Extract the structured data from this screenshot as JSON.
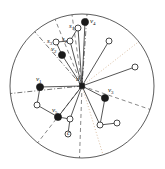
{
  "figure": {
    "type": "node-link-diagram-in-disk",
    "background": "#ffffff",
    "width": 165,
    "height": 169,
    "boundary": {
      "name": "disk-boundary",
      "shape": "circle",
      "cx": 82,
      "cy": 86,
      "r": 72,
      "stroke": "#4a4a4a",
      "stroke_width": 0.9
    },
    "center_node": {
      "id": "u",
      "label": "u",
      "label_text": "u",
      "x": 82,
      "y": 86,
      "marker": "filled-square",
      "size": 5,
      "color": "#1a1a1a",
      "label_dx": -6,
      "label_dy": -10
    }
  },
  "colors": {
    "ink": "#1a1a1a",
    "edge": "#2b2b2b",
    "boundary": "#4a4a4a",
    "dashdot_ray": "#3a3a3a",
    "dashed_ray": "#555555",
    "dotted_ray": "#c8a27a",
    "open_node_fill": "#ffffff"
  },
  "legend_note": "",
  "sector_rays": [
    {
      "name": "ray-west-dashdot",
      "angle_deg": 186,
      "style": "dashdot",
      "color": "#3a3a3a"
    },
    {
      "name": "ray-northwest-dashdot",
      "angle_deg": 131,
      "style": "dashdot",
      "color": "#3a3a3a"
    },
    {
      "name": "ray-north-dashdot",
      "angle_deg": 86,
      "style": "dashdot",
      "color": "#3a3a3a"
    },
    {
      "name": "ray-north-dashed-a",
      "angle_deg": 98,
      "style": "dashed",
      "color": "#555555"
    },
    {
      "name": "ray-northwest-dashed-b",
      "angle_deg": 112,
      "style": "dashed",
      "color": "#555555"
    },
    {
      "name": "ray-northeast-dotted",
      "angle_deg": 38,
      "style": "dotted",
      "color": "#c8a27a"
    },
    {
      "name": "ray-east-dashed",
      "angle_deg": 341,
      "style": "dashed",
      "color": "#555555"
    },
    {
      "name": "ray-southeast-dotted",
      "angle_deg": 287,
      "style": "dotted",
      "color": "#c8a27a"
    },
    {
      "name": "ray-south-dashed",
      "angle_deg": 268,
      "style": "dashed",
      "color": "#555555"
    },
    {
      "name": "ray-southwest-dashed",
      "angle_deg": 232,
      "style": "dashed",
      "color": "#555555"
    }
  ],
  "filled_nodes": [
    {
      "id": "v1",
      "label": "v",
      "sub": "1",
      "x": 40,
      "y": 87,
      "r": 3.6,
      "label_dx": -4,
      "label_dy": -11
    },
    {
      "id": "v2",
      "label": "v",
      "sub": "2",
      "x": 62,
      "y": 55,
      "r": 3.6,
      "label_dx": -11,
      "label_dy": -9
    },
    {
      "id": "v3",
      "label": "v",
      "sub": "3",
      "x": 105,
      "y": 98,
      "r": 3.6,
      "label_dx": 3,
      "label_dy": -11
    },
    {
      "id": "v4",
      "label": "v",
      "sub": "4",
      "x": 85,
      "y": 22,
      "r": 3.6,
      "label_dx": 5,
      "label_dy": -4
    },
    {
      "id": "v5",
      "label": "v",
      "sub": "5",
      "x": 58,
      "y": 117,
      "r": 3.6,
      "label_dx": -6,
      "label_dy": -10
    }
  ],
  "open_nodes": [
    {
      "id": "s1",
      "label": "s",
      "sub": "1",
      "x": 78,
      "y": 28,
      "r": 3.0,
      "label_dx": -9,
      "label_dy": -5
    },
    {
      "id": "s2",
      "label": "s",
      "sub": "2",
      "x": 70,
      "y": 41,
      "r": 3.0,
      "label_dx": -8,
      "label_dy": -5
    },
    {
      "id": "s3",
      "label": "s",
      "sub": "3",
      "x": 56,
      "y": 42,
      "r": 3.0,
      "label_dx": -9,
      "label_dy": -4
    },
    {
      "id": "n1",
      "label": "",
      "sub": "",
      "x": 109,
      "y": 41,
      "r": 3.0,
      "label_dx": 0,
      "label_dy": 0
    },
    {
      "id": "n2",
      "label": "",
      "sub": "",
      "x": 135,
      "y": 67,
      "r": 3.0,
      "label_dx": 0,
      "label_dy": 0
    },
    {
      "id": "n3",
      "label": "",
      "sub": "",
      "x": 37,
      "y": 105,
      "r": 3.0,
      "label_dx": 0,
      "label_dy": 0
    },
    {
      "id": "n4",
      "label": "",
      "sub": "",
      "x": 70,
      "y": 119,
      "r": 3.0,
      "label_dx": 0,
      "label_dy": 0
    },
    {
      "id": "n5",
      "label": "c",
      "sub": "",
      "x": 68,
      "y": 134,
      "r": 3.0,
      "label_dx": -1,
      "label_dy": -4
    },
    {
      "id": "n6",
      "label": "",
      "sub": "",
      "x": 100,
      "y": 125,
      "r": 3.0,
      "label_dx": 0,
      "label_dy": 0
    },
    {
      "id": "n7",
      "label": "",
      "sub": "",
      "x": 117,
      "y": 123,
      "r": 3.0,
      "label_dx": 0,
      "label_dy": 0
    }
  ],
  "edges": [
    {
      "name": "edge-u-v1",
      "from": "u",
      "to": "v1",
      "style": "solid"
    },
    {
      "name": "edge-u-v2",
      "from": "u",
      "to": "v2",
      "style": "solid"
    },
    {
      "name": "edge-u-v3",
      "from": "u",
      "to": "v3",
      "style": "solid"
    },
    {
      "name": "edge-u-v4",
      "from": "u",
      "to": "v4",
      "style": "solid"
    },
    {
      "name": "edge-u-v5",
      "from": "u",
      "to": "v5",
      "style": "solid"
    },
    {
      "name": "edge-u-s1",
      "from": "u",
      "to": "s1",
      "style": "solid"
    },
    {
      "name": "edge-u-s2",
      "from": "u",
      "to": "s2",
      "style": "solid"
    },
    {
      "name": "edge-u-n1",
      "from": "u",
      "to": "n1",
      "style": "solid"
    },
    {
      "name": "edge-u-n2",
      "from": "u",
      "to": "n2",
      "style": "solid"
    },
    {
      "name": "edge-u-n4",
      "from": "u",
      "to": "n4",
      "style": "solid"
    },
    {
      "name": "edge-u-n6",
      "from": "u",
      "to": "n6",
      "style": "solid"
    },
    {
      "name": "edge-v1-n3",
      "from": "v1",
      "to": "n3",
      "style": "solid"
    },
    {
      "name": "edge-v2-s3",
      "from": "v2",
      "to": "s3",
      "style": "solid"
    },
    {
      "name": "edge-s3-s2",
      "from": "s3",
      "to": "s2",
      "style": "solid"
    },
    {
      "name": "edge-s2-s1",
      "from": "s2",
      "to": "s1",
      "style": "solid"
    },
    {
      "name": "edge-n3-v5",
      "from": "n3",
      "to": "v5",
      "style": "solid"
    },
    {
      "name": "edge-v5-n4",
      "from": "v5",
      "to": "n4",
      "style": "solid"
    },
    {
      "name": "edge-n4-n5",
      "from": "n4",
      "to": "n5",
      "style": "solid"
    },
    {
      "name": "edge-v3-n6",
      "from": "v3",
      "to": "n6",
      "style": "solid"
    },
    {
      "name": "edge-n6-n7",
      "from": "n6",
      "to": "n7",
      "style": "solid"
    }
  ]
}
